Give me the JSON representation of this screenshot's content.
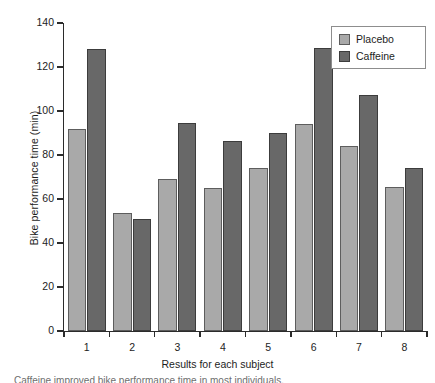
{
  "chart_data": {
    "type": "bar",
    "title": "",
    "xlabel": "Results for each subject",
    "ylabel": "Bike performance time (min)",
    "categories": [
      "1",
      "2",
      "3",
      "4",
      "5",
      "6",
      "7",
      "8"
    ],
    "series": [
      {
        "name": "Placebo",
        "color": "#a9a9a9",
        "values": [
          92,
          53.5,
          69,
          65,
          74,
          94,
          84,
          65.5
        ]
      },
      {
        "name": "Caffeine",
        "color": "#686868",
        "values": [
          128,
          51,
          94.5,
          86.5,
          90,
          128.5,
          107.5,
          74
        ]
      }
    ],
    "ylim": [
      0,
      140
    ],
    "yticks": [
      0,
      20,
      40,
      60,
      80,
      100,
      120,
      140
    ],
    "ytick_labels": [
      "0",
      "20",
      "40",
      "60",
      "80",
      "100",
      "120",
      "140"
    ],
    "grid": false,
    "legend_position": "top-right"
  },
  "legend": {
    "entries": [
      {
        "label": "Placebo"
      },
      {
        "label": "Caffeine"
      }
    ]
  },
  "caption": "Caffeine improved bike performance time in most individuals."
}
